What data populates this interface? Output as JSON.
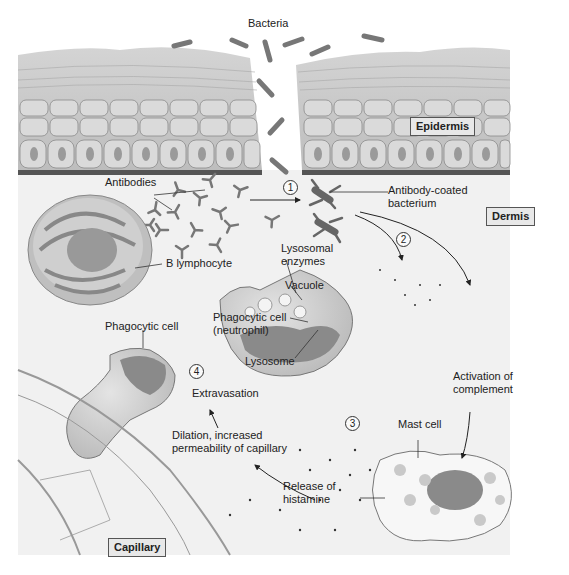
{
  "labels": {
    "bacteria": "Bacteria",
    "epidermis": "Epidermis",
    "dermis": "Dermis",
    "capillary": "Capillary",
    "antibodies": "Antibodies",
    "antibody_coated_1": "Antibody-coated",
    "antibody_coated_2": "bacterium",
    "b_lymphocyte": "B lymphocyte",
    "lysosomal_1": "Lysosomal",
    "lysosomal_2": "enzymes",
    "vacuole": "Vacuole",
    "phago_neutro_1": "Phagocytic cell",
    "phago_neutro_2": "(neutrophil)",
    "lysosome": "Lysosome",
    "phagocytic_cell": "Phagocytic cell",
    "extravasation": "Extravasation",
    "dilation_1": "Dilation, increased",
    "dilation_2": "permeability of capillary",
    "activation_1": "Activation of",
    "activation_2": "complement",
    "mast_cell": "Mast cell",
    "histamine_1": "Release of",
    "histamine_2": "histamine"
  },
  "steps": [
    "1",
    "2",
    "3",
    "4"
  ],
  "colors": {
    "skin": "#c9c9c9",
    "cell_fill": "#d8d8d8",
    "nucleus": "#8a8a8a",
    "bacteria": "#7a7a7a",
    "dermis_bg": "#f3f3f3",
    "capillary": "#c4c4c4"
  }
}
